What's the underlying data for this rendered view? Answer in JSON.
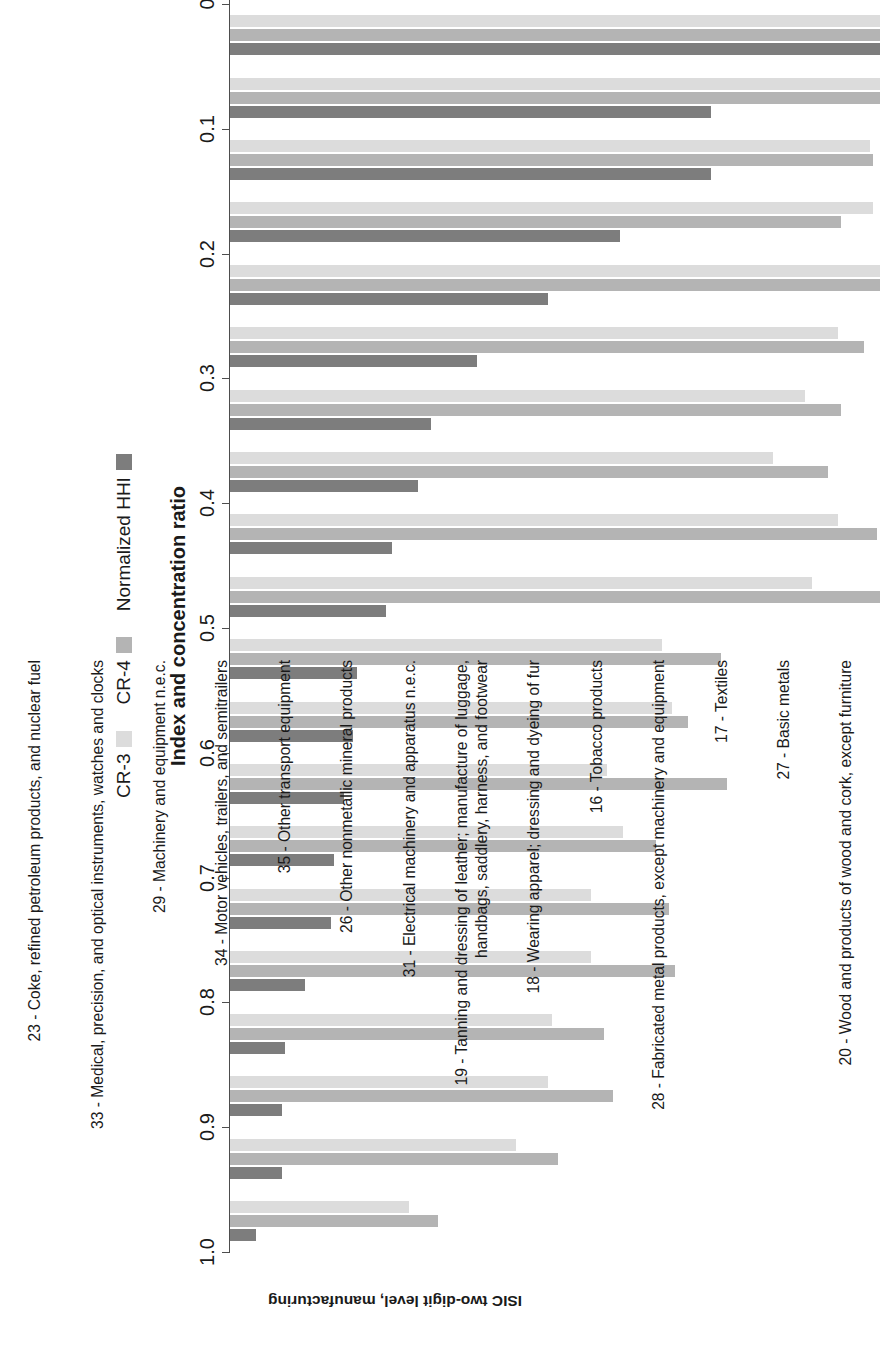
{
  "chart_data": {
    "type": "bar",
    "orientation": "horizontal",
    "title": "",
    "xlabel": "Index and concentration ratio",
    "ylabel": "ISIC two-digit level, manufacturing",
    "xlim": [
      0,
      1.0
    ],
    "xticks": [
      "0",
      "0.1",
      "0.2",
      "0.3",
      "0.4",
      "0.5",
      "0.6",
      "0.7",
      "0.8",
      "0.9",
      "1.0"
    ],
    "xtick_values": [
      0,
      0.1,
      0.2,
      0.3,
      0.4,
      0.5,
      0.6,
      0.7,
      0.8,
      0.9,
      1.0
    ],
    "grid": false,
    "legend_position": "bottom",
    "categories": [
      "23 - Coke, refined petroleum products, and nuclear fuel",
      "33 - Medical, precision, and optical instruments, watches and clocks",
      "29 - Machinery and equipment n.e.c.",
      "34 - Motor vehicles, trailers, and semitrailers",
      "35 - Other transport equipment",
      "26 - Other nonmetallic mineral products",
      "31 - Electrical machinery and apparatus n.e.c.",
      "19 - Tanning and dressing of leather; manufacture of luggage,\nhandbags, saddlery, harness, and footwear",
      "18 - Wearing apparel; dressing and dyeing of fur",
      "16 - Tobacco products",
      "28 - Fabricated metal products, except machinery and equipment",
      "17 - Textiles",
      "27 - Basic metals",
      "20 - Wood and products of wood and cork, except furniture",
      "36 - Furniture; manufacturing n.e.c.",
      "25 - Rubber and plastics products",
      "21 - Paper and paper products",
      "22 - Publishing, printing, and reproduction of recorded media",
      "24 - Chemicals and chemical products",
      "15 - Food products and beverages"
    ],
    "series": [
      {
        "name": "Normalized HHI",
        "color": "#7d7d7d",
        "values": [
          1.0,
          0.74,
          0.74,
          0.6,
          0.49,
          0.38,
          0.31,
          0.29,
          0.25,
          0.24,
          0.195,
          0.19,
          0.175,
          0.16,
          0.155,
          0.115,
          0.085,
          0.08,
          0.08,
          0.04
        ]
      },
      {
        "name": "CR-4",
        "color": "#b4b4b4",
        "values": [
          1.0,
          1.0,
          0.99,
          0.94,
          1.0,
          0.975,
          0.94,
          0.92,
          0.995,
          1.0,
          0.755,
          0.705,
          0.765,
          0.655,
          0.675,
          0.685,
          0.575,
          0.59,
          0.505,
          0.32
        ]
      },
      {
        "name": "CR-3",
        "color": "#dcdcdc",
        "values": [
          1.0,
          1.0,
          0.985,
          0.99,
          1.0,
          0.935,
          0.885,
          0.835,
          0.935,
          0.895,
          0.665,
          0.68,
          0.58,
          0.605,
          0.555,
          0.555,
          0.495,
          0.49,
          0.44,
          0.275
        ]
      }
    ]
  },
  "legend": {
    "items": [
      {
        "label": "Normalized HHI",
        "color": "#7d7d7d"
      },
      {
        "label": "CR-4",
        "color": "#b4b4b4"
      },
      {
        "label": "CR-3",
        "color": "#dcdcdc"
      }
    ]
  },
  "axes": {
    "value_axis_title": "Index and concentration ratio",
    "category_axis_title": "ISIC two-digit level, manufacturing"
  }
}
